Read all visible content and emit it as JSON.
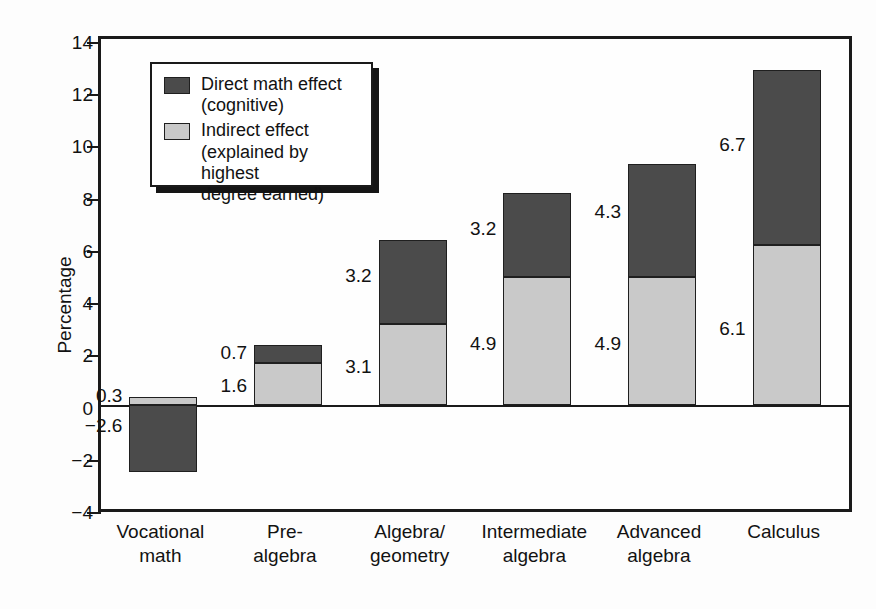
{
  "chart_data": {
    "type": "bar",
    "stacked": true,
    "title": "",
    "xlabel": "",
    "ylabel": "Percentage",
    "ylim": [
      -4,
      14
    ],
    "ytick_step": 2,
    "yticks": [
      "14",
      "12",
      "10",
      "8",
      "6",
      "4",
      "2",
      "0",
      "−2",
      "−4"
    ],
    "grid": false,
    "legend_position": "upper-left-inside",
    "categories": [
      "Vocational math",
      "Pre-algebra",
      "Algebra/geometry",
      "Intermediate algebra",
      "Advanced algebra",
      "Calculus"
    ],
    "category_lines": [
      [
        "Vocational",
        "math"
      ],
      [
        "Pre-",
        "algebra"
      ],
      [
        "Algebra/",
        "geometry"
      ],
      [
        "Intermediate",
        "algebra"
      ],
      [
        "Advanced",
        "algebra"
      ],
      [
        "Calculus",
        ""
      ]
    ],
    "series": [
      {
        "name": "Indirect effect (explained by highest degree earned)",
        "key": "indirect",
        "color": "#c9c9c9",
        "values": [
          0.3,
          1.6,
          3.1,
          4.9,
          4.9,
          6.1
        ],
        "labels": [
          "0.3",
          "1.6",
          "3.1",
          "4.9",
          "4.9",
          "6.1"
        ]
      },
      {
        "name": "Direct math effect (cognitive)",
        "key": "direct",
        "color": "#4b4b4b",
        "values": [
          -2.6,
          0.7,
          3.2,
          3.2,
          4.3,
          6.7
        ],
        "labels": [
          "−2.6",
          "0.7",
          "3.2",
          "3.2",
          "4.3",
          "6.7"
        ]
      }
    ],
    "totals": [
      -2.3,
      2.3,
      6.3,
      8.1,
      9.2,
      12.8
    ]
  },
  "legend": {
    "items": [
      {
        "swatch": "direct",
        "line1": "Direct math effect",
        "line2": "(cognitive)",
        "line3": ""
      },
      {
        "swatch": "indirect",
        "line1": "Indirect effect",
        "line2": "(explained by highest",
        "line3": "degree earned)"
      }
    ]
  },
  "colors": {
    "direct": "#4b4b4b",
    "indirect": "#c9c9c9",
    "axis": "#1a1a1a",
    "background": "#ffffff"
  }
}
